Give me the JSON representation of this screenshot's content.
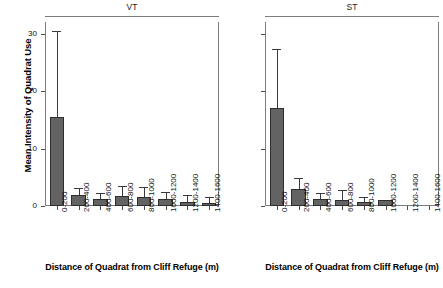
{
  "chart_data": {
    "type": "bar",
    "title": "",
    "ylabel": "Mean Intensity of Quadrat Use",
    "xlabel": "Distance of Quadrat from Cliff Refuge (m)",
    "ylim": [
      0,
      32
    ],
    "yticks": [
      0,
      10,
      20,
      30
    ],
    "ytick_labels": [
      "0",
      "10",
      "20",
      "30"
    ],
    "grid": false,
    "legend": "none",
    "error_bars": "upper only (SE/SD whisker)",
    "categories": [
      "0-200",
      "200-400",
      "400-600",
      "600-800",
      "800-1000",
      "1000-1200",
      "1200-1400",
      "1400-1600"
    ],
    "panels": [
      {
        "label": "VT",
        "y_axis_labeled": true,
        "values": [
          15.4,
          1.9,
          1.2,
          1.7,
          1.6,
          1.3,
          0.7,
          0.6
        ],
        "errors_upper": [
          30.4,
          3.1,
          2.2,
          3.4,
          3.3,
          2.5,
          1.9,
          1.5
        ]
      },
      {
        "label": "ST",
        "y_axis_labeled": false,
        "values": [
          17.1,
          3.0,
          1.2,
          1.1,
          0.7,
          1.0,
          0.0,
          0.0
        ],
        "errors_upper": [
          27.3,
          4.9,
          2.2,
          2.7,
          1.6,
          1.0,
          0.0,
          0.0
        ]
      }
    ]
  },
  "axis": {
    "ylabel": "Mean Intensity of Quadrat Use",
    "xlabel_left": "Distance of Quadrat from Cliff Refuge (m)",
    "xlabel_right": "Distance of Quadrat from Cliff Refuge (m)",
    "ytick_labels": [
      "30",
      "20",
      "10",
      "0"
    ]
  },
  "panels": {
    "left_title": "VT",
    "right_title": "ST"
  },
  "xcats": [
    "0-200",
    "200-400",
    "400-600",
    "600-800",
    "800-1000",
    "1000-1200",
    "1200-1400",
    "1400-1600"
  ],
  "colors": {
    "bar_fill": "#636363",
    "bar_stroke": "#2e2e2e",
    "frame": "#7d7d7d",
    "text": "#111111",
    "background": "#ffffff"
  }
}
